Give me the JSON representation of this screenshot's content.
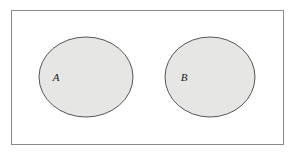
{
  "diagram": {
    "type": "venn-disjoint",
    "background_color": "#ffffff",
    "universe": {
      "name": "universal-set-frame",
      "shape": "rectangle",
      "x": 11,
      "y": 10,
      "width": 272,
      "height": 134,
      "fill": "#ffffff",
      "stroke": "#8a8a8a",
      "stroke_width": 1
    },
    "sets": [
      {
        "label": "A",
        "shape": "ellipse",
        "cx": 86,
        "cy": 77,
        "rx": 47,
        "ry": 40,
        "fill": "#e6e6e4",
        "stroke": "#555555",
        "stroke_width": 1,
        "label_x": 56,
        "label_y": 77,
        "label_color": "#1a1a1a"
      },
      {
        "label": "B",
        "shape": "ellipse",
        "cx": 210,
        "cy": 77,
        "rx": 45,
        "ry": 40,
        "fill": "#e6e6e4",
        "stroke": "#555555",
        "stroke_width": 1,
        "label_x": 184,
        "label_y": 77,
        "label_color": "#1a1a1a"
      }
    ]
  }
}
